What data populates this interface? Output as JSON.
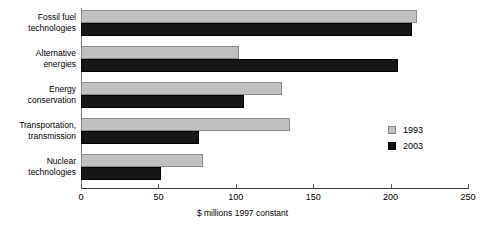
{
  "chart_data": {
    "type": "bar",
    "orientation": "horizontal",
    "title": "",
    "xlabel": "$ millions 1997 constant",
    "ylabel": "",
    "xlim": [
      0,
      250
    ],
    "xticks": [
      0,
      50,
      100,
      150,
      200,
      250
    ],
    "grid": false,
    "legend_position": "right-middle",
    "categories": [
      "Fossil fuel\ntechnologies",
      "Alternative\nenergies",
      "Energy\nconservation",
      "Transportation,\ntransmission",
      "Nuclear\ntechnologies"
    ],
    "series": [
      {
        "name": "1993",
        "color": "#c0c0c0",
        "values": [
          217,
          102,
          130,
          135,
          79
        ]
      },
      {
        "name": "2003",
        "color": "#111111",
        "values": [
          214,
          205,
          105,
          76,
          52
        ]
      }
    ]
  },
  "axis": {
    "tick_labels": [
      "0",
      "50",
      "100",
      "150",
      "200",
      "250"
    ],
    "x_title": "$ millions 1997 constant"
  },
  "legend": {
    "items": [
      {
        "label": "1993"
      },
      {
        "label": "2003"
      }
    ]
  }
}
